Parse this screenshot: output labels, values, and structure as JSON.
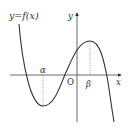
{
  "diagram": {
    "title": "y=f(x)",
    "axes": {
      "x_label": "x",
      "y_label": "y",
      "origin_label": "O"
    },
    "points": {
      "alpha": "α",
      "beta": "β"
    },
    "colors": {
      "curve": "#333333",
      "axis": "#444444",
      "dashed": "#888888",
      "background": "#ffffff"
    }
  }
}
